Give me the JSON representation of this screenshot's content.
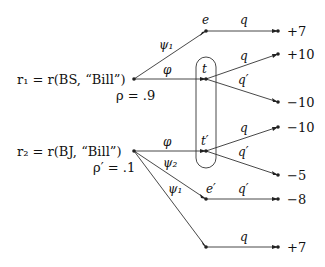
{
  "diagram": {
    "roots": [
      {
        "label": "r₁ = r(BS, “Bill”)",
        "prob": "ρ = .9"
      },
      {
        "label": "r₂ = r(BJ, “Bill”)",
        "prob": "ρ′ = .1"
      }
    ],
    "nodes": {
      "e": "e",
      "t": "t",
      "t_prime": "t′",
      "e_prime": "e′"
    },
    "edge_labels": {
      "r1_e": "ψ₁",
      "r1_t": "φ",
      "r2_tp": "φ",
      "r2_ep": "ψ₂",
      "r2_bottom": "ψ₁",
      "e_out": "q",
      "t_q": "q",
      "t_qp": "q′",
      "tp_q": "q",
      "tp_qp": "q′",
      "ep_out": "q′",
      "bottom_out": "q"
    },
    "payoffs": [
      "+7",
      "+10",
      "−10",
      "−10",
      "−5",
      "−8",
      "+7"
    ],
    "colors": {
      "line": "#333333",
      "text": "#111111"
    }
  }
}
